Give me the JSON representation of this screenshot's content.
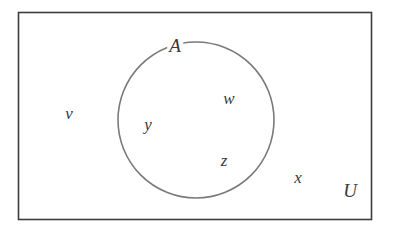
{
  "diagram": {
    "type": "venn",
    "universe": {
      "label": "U",
      "shape": "rectangle",
      "x": 18,
      "y": 12,
      "width": 353,
      "height": 207,
      "stroke": "#3c3c3c"
    },
    "sets": [
      {
        "label": "A",
        "shape": "circle",
        "cx": 196,
        "cy": 120,
        "r": 78,
        "stroke": "#7a7a7a",
        "elements": [
          "w",
          "y",
          "z"
        ]
      }
    ],
    "outside_elements": [
      "v",
      "x"
    ],
    "labels": {
      "U": {
        "text": "U",
        "x": 350,
        "y": 190
      },
      "A": {
        "text": "A",
        "x": 175,
        "y": 44
      },
      "v": {
        "text": "v",
        "x": 69,
        "y": 114
      },
      "w": {
        "text": "w",
        "x": 229,
        "y": 99
      },
      "y": {
        "text": "y",
        "x": 148,
        "y": 126
      },
      "z": {
        "text": "z",
        "x": 224,
        "y": 161
      },
      "x": {
        "text": "x",
        "x": 298,
        "y": 178
      }
    }
  }
}
